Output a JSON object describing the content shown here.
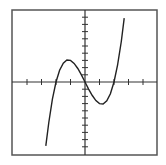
{
  "chart_data": {
    "type": "line",
    "title": "",
    "xlabel": "",
    "ylabel": "",
    "xlim": [
      -5,
      5
    ],
    "ylim": [
      -10,
      10
    ],
    "xtick_step": 1,
    "ytick_step": 1,
    "tick_labels_shown": false,
    "grid": false,
    "legend": null,
    "axes_scale_note": "No tick labels are visible. Ranges are estimated from tick counts: about 4 ticks on each side of the y-axis along the x-axis, and about 10 ticks per side along the y-axis; unit scale per tick is assumed.",
    "curve_note": "Curve shape fitted by eye; formula is an inference, not displayed in the image.",
    "series": [
      {
        "name": "estimated f(x) ≈ x^3 - 4x (inferred, not shown)",
        "formula_estimate": "x^3 - 4x",
        "approx_roots": [
          -2,
          0,
          2
        ],
        "approx_local_max": [
          -1.15,
          3.1
        ],
        "approx_local_min": [
          1.15,
          -3.1
        ],
        "x": [
          -2.7,
          -2.5,
          -2.25,
          -2,
          -1.75,
          -1.5,
          -1.25,
          -1,
          -0.75,
          -0.5,
          -0.25,
          0,
          0.25,
          0.5,
          0.75,
          1,
          1.25,
          1.5,
          1.75,
          2,
          2.25,
          2.5,
          2.7
        ],
        "y": [
          -8.88,
          -5.63,
          -2.39,
          0,
          1.64,
          2.63,
          3.05,
          3.0,
          2.58,
          1.88,
          0.98,
          0,
          -0.98,
          -1.88,
          -2.58,
          -3.0,
          -3.05,
          -2.63,
          -1.64,
          0,
          2.39,
          5.63,
          8.88
        ]
      }
    ]
  },
  "colors": {
    "frame": "#555555",
    "axes": "#333333",
    "curve": "#222222",
    "background": "#ffffff"
  },
  "layout": {
    "frame": {
      "left": 12,
      "top": 10,
      "right": 157,
      "bottom": 155
    },
    "origin_px": {
      "x": 85,
      "y": 82
    },
    "px_per_x_unit": 14.5,
    "px_per_y_unit": 7.2
  }
}
